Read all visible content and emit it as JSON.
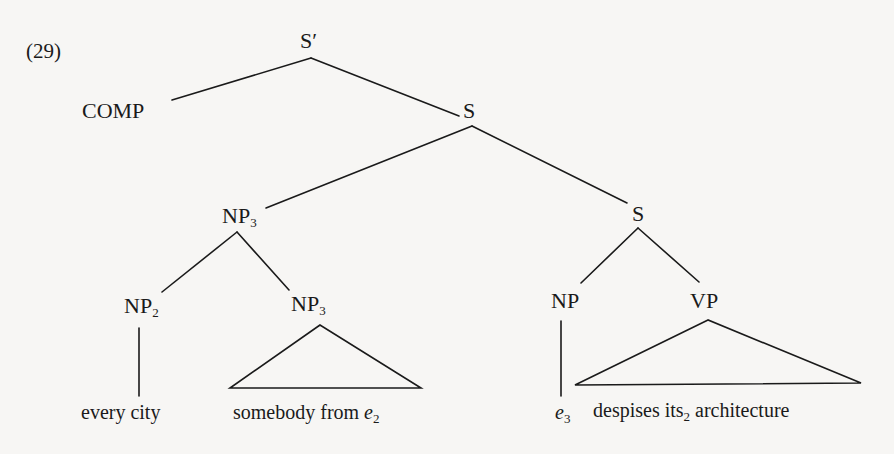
{
  "example_number": "(29)",
  "nodes": {
    "root": {
      "label": "S′"
    },
    "comp": {
      "label": "COMP"
    },
    "s1": {
      "label": "S"
    },
    "np3_upper": {
      "label": "NP",
      "index": "3"
    },
    "s2": {
      "label": "S"
    },
    "np2": {
      "label": "NP",
      "index": "2"
    },
    "np3_lower": {
      "label": "NP",
      "index": "3"
    },
    "np": {
      "label": "NP"
    },
    "vp": {
      "label": "VP"
    }
  },
  "leaves": {
    "every_city": {
      "text": "every city"
    },
    "somebody_from": {
      "text": "somebody from ",
      "trace": "e",
      "trace_index": "2"
    },
    "e3": {
      "trace": "e",
      "trace_index": "3"
    },
    "despises": {
      "pre": "despises its",
      "index": "2",
      "post": " architecture"
    }
  },
  "colors": {
    "background": "#f7f6f4",
    "ink": "#1a1a1a"
  }
}
